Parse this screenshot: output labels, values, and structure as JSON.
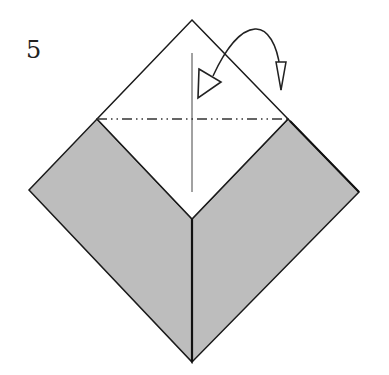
{
  "step": {
    "number": "5"
  },
  "diagram": {
    "type": "origami-fold-step",
    "colors": {
      "paper_front": "#ffffff",
      "paper_back": "#bdbdbd",
      "outline": "#1a1a1a",
      "crease": "#333333"
    },
    "fold_line": {
      "style": "mountain-fold (dash-dot-dot)"
    },
    "arrow": {
      "style": "fold-behind",
      "direction": "over top corner, back and down"
    }
  }
}
